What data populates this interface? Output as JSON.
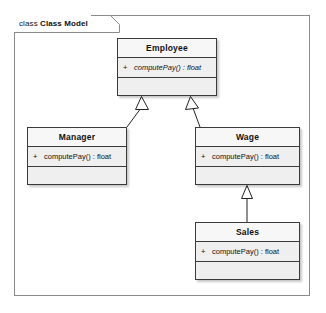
{
  "frame": {
    "keyword": "class",
    "name": "Class Model",
    "label": "class Class Model"
  },
  "colors": {
    "frame_border": "#8a8a8a",
    "class_border": "#3a3a3a",
    "class_body_fill": "#efefef",
    "class_title_fill": "#f7f7f7",
    "connector": "#222222",
    "canvas": "#ffffff",
    "text": "#111111"
  },
  "classes": [
    {
      "id": "employee",
      "name": "Employee",
      "abstract": true,
      "operations": [
        {
          "visibility": "+",
          "signature": "computePay() : float",
          "abstract": true
        }
      ]
    },
    {
      "id": "manager",
      "name": "Manager",
      "abstract": false,
      "operations": [
        {
          "visibility": "+",
          "signature": "computePay() : float",
          "abstract": false
        }
      ]
    },
    {
      "id": "wage",
      "name": "Wage",
      "abstract": false,
      "operations": [
        {
          "visibility": "+",
          "signature": "computePay() : float",
          "abstract": false
        }
      ]
    },
    {
      "id": "sales",
      "name": "Sales",
      "abstract": false,
      "operations": [
        {
          "visibility": "+",
          "signature": "computePay() : float",
          "abstract": false
        }
      ]
    }
  ],
  "relationships": [
    {
      "id": "manager-employee",
      "type": "generalization",
      "source": "Manager",
      "target": "Employee"
    },
    {
      "id": "wage-employee",
      "type": "generalization",
      "source": "Wage",
      "target": "Employee"
    },
    {
      "id": "sales-wage",
      "type": "generalization",
      "source": "Sales",
      "target": "Wage"
    }
  ]
}
